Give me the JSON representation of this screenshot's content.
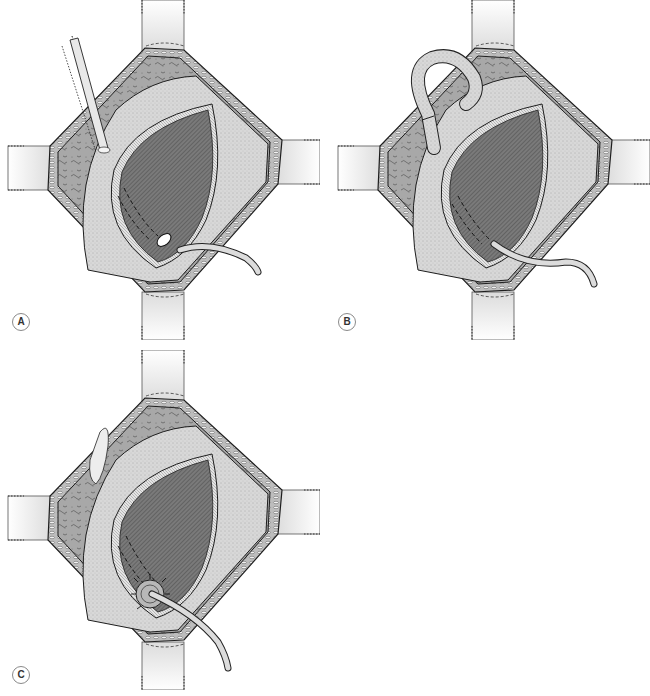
{
  "figure": {
    "panels": [
      {
        "id": "A",
        "label": "A",
        "instrument": "forceps",
        "drain": "catheter-through-wall",
        "closure": "open"
      },
      {
        "id": "B",
        "label": "B",
        "instrument": "looped-tube",
        "drain": "catheter-through-wall",
        "closure": "open"
      },
      {
        "id": "C",
        "label": "C",
        "instrument": "none",
        "drain": "catheter-purse-string-sutured",
        "closure": "purse-string"
      }
    ]
  },
  "colors": {
    "background": "#ffffff",
    "retractor": "#e6e6e6",
    "retractor_edge": "#3a3a3a",
    "fascia": "#9a9a9a",
    "fat_layer": "#b5b5b5",
    "organ_wall": "#d6d6d6",
    "lumen": "#6e6e6e",
    "mucosa_rim": "#cfcfcf",
    "tube": "#d9d9d9",
    "outline": "#1e1e1e"
  }
}
